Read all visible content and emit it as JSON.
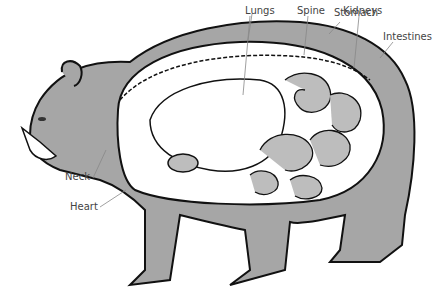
{
  "diagram": {
    "colors": {
      "fur": "#a6a6a6",
      "outline": "#111111",
      "organ": "#ffffff",
      "organ_shade": "#bdbdbd",
      "leader": "#888888"
    },
    "labels": [
      {
        "id": "lungs",
        "text": "Lungs",
        "x": 245,
        "y": 6
      },
      {
        "id": "spine",
        "text": "Spine",
        "x": 297,
        "y": 6
      },
      {
        "id": "kidneys",
        "text": "Kidneys",
        "x": 343,
        "y": 6
      },
      {
        "id": "stomach",
        "text": "Stomach",
        "x": 398,
        "y": 8
      },
      {
        "id": "intestines",
        "text": "Intestines",
        "x": 383,
        "y": 32
      },
      {
        "id": "neck",
        "text": "Neck",
        "x": 65,
        "y": 172
      },
      {
        "id": "heart",
        "text": "Heart",
        "x": 70,
        "y": 202
      }
    ]
  }
}
